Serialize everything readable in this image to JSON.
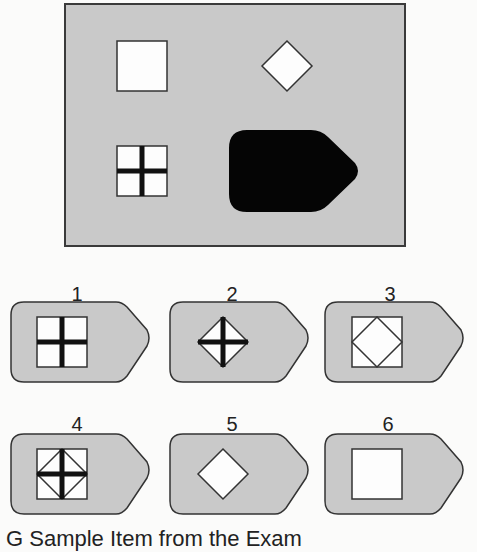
{
  "puzzle": {
    "matrix": {
      "background_color": "#c9c9c9",
      "cells": [
        {
          "position": "top-left",
          "shape": "square"
        },
        {
          "position": "top-right",
          "shape": "diamond"
        },
        {
          "position": "bottom-left",
          "shape": "square-with-cross"
        },
        {
          "position": "bottom-right",
          "shape": "black-pentagon-tag"
        }
      ]
    },
    "options": [
      {
        "label": "1",
        "figure": "square-with-thick-cross"
      },
      {
        "label": "2",
        "figure": "diamond-with-thick-cross"
      },
      {
        "label": "3",
        "figure": "diamond-in-square"
      },
      {
        "label": "4",
        "figure": "diamond-in-square-with-thick-cross"
      },
      {
        "label": "5",
        "figure": "diamond"
      },
      {
        "label": "6",
        "figure": "square"
      }
    ],
    "caption": "G Sample Item from the Exam"
  }
}
